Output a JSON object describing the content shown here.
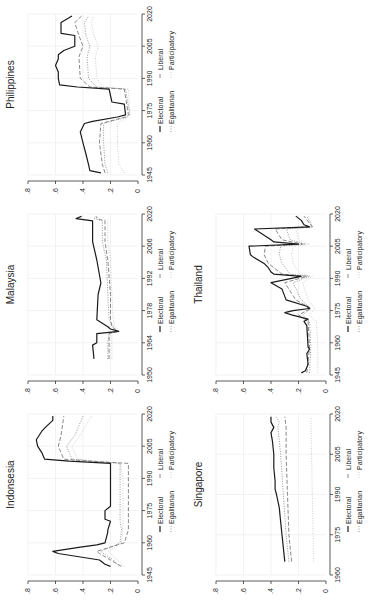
{
  "chart_data": [
    {
      "type": "line",
      "title": "Philippines",
      "xlabel": "",
      "ylabel": "",
      "xticks": [
        1945,
        1960,
        1975,
        1990,
        2005,
        2020
      ],
      "yticks": [
        0,
        0.2,
        0.4,
        0.6,
        0.8
      ],
      "ylim": [
        0,
        0.8
      ],
      "xlim": [
        1945,
        2020
      ],
      "grid": true,
      "legend": [
        "Electoral",
        "Liberal",
        "Egalitarian",
        "Participatory"
      ],
      "series": [
        {
          "name": "Electoral",
          "x": [
            1946,
            1947,
            1950,
            1955,
            1960,
            1965,
            1969,
            1970,
            1972,
            1973,
            1978,
            1979,
            1985,
            1986,
            1987,
            1990,
            1993,
            1996,
            1999,
            2001,
            2003,
            2005,
            2010,
            2011,
            2016,
            2019
          ],
          "values": [
            0.27,
            0.35,
            0.36,
            0.38,
            0.4,
            0.42,
            0.39,
            0.33,
            0.15,
            0.09,
            0.1,
            0.19,
            0.21,
            0.44,
            0.57,
            0.58,
            0.58,
            0.6,
            0.58,
            0.58,
            0.54,
            0.46,
            0.46,
            0.56,
            0.56,
            0.48
          ]
        },
        {
          "name": "Liberal",
          "x": [
            1946,
            1950,
            1960,
            1969,
            1972,
            1973,
            1985,
            1986,
            1990,
            2000,
            2005,
            2010,
            2016,
            2019
          ],
          "values": [
            0.24,
            0.26,
            0.28,
            0.27,
            0.09,
            0.07,
            0.1,
            0.35,
            0.42,
            0.43,
            0.4,
            0.43,
            0.46,
            0.41
          ]
        },
        {
          "name": "Egalitarian",
          "x": [
            1946,
            1950,
            1960,
            1969,
            1972,
            1973,
            1985,
            1986,
            1990,
            2000,
            2005,
            2010,
            2016,
            2019
          ],
          "values": [
            0.22,
            0.24,
            0.25,
            0.25,
            0.08,
            0.06,
            0.09,
            0.3,
            0.36,
            0.37,
            0.35,
            0.38,
            0.39,
            0.36
          ]
        },
        {
          "name": "Participatory",
          "x": [
            1946,
            1950,
            1960,
            1969,
            1972,
            1973,
            1985,
            1986,
            1990,
            2000,
            2005,
            2010,
            2016,
            2019
          ],
          "values": [
            0.1,
            0.14,
            0.15,
            0.15,
            0.07,
            0.06,
            0.07,
            0.25,
            0.3,
            0.31,
            0.29,
            0.32,
            0.34,
            0.32
          ]
        }
      ]
    },
    {
      "type": "line",
      "title": "Malaysia",
      "xticks": [
        1950,
        1964,
        1978,
        1992,
        2006,
        2020
      ],
      "yticks": [
        0,
        0.2,
        0.4,
        0.6,
        0.8
      ],
      "ylim": [
        0,
        0.8
      ],
      "xlim": [
        1950,
        2020
      ],
      "grid": true,
      "legend": [
        "Electoral",
        "Liberal",
        "Egalitarian",
        "Participatory"
      ],
      "series": [
        {
          "name": "Electoral",
          "x": [
            1957,
            1963,
            1964,
            1968,
            1969,
            1970,
            1971,
            1974,
            1985,
            1990,
            2000,
            2008,
            2017,
            2018,
            2019
          ],
          "values": [
            0.32,
            0.33,
            0.3,
            0.3,
            0.14,
            0.2,
            0.22,
            0.3,
            0.29,
            0.27,
            0.3,
            0.33,
            0.33,
            0.45,
            0.41
          ]
        },
        {
          "name": "Liberal",
          "x": [
            1957,
            1964,
            1968,
            1969,
            1971,
            1974,
            1985,
            2000,
            2008,
            2017,
            2018,
            2019
          ],
          "values": [
            0.21,
            0.21,
            0.21,
            0.15,
            0.19,
            0.2,
            0.2,
            0.22,
            0.24,
            0.24,
            0.3,
            0.3
          ]
        },
        {
          "name": "Egalitarian",
          "x": [
            1957,
            1964,
            1968,
            1969,
            1971,
            1974,
            1985,
            2000,
            2008,
            2017,
            2018,
            2019
          ],
          "values": [
            0.22,
            0.22,
            0.21,
            0.15,
            0.18,
            0.21,
            0.22,
            0.23,
            0.26,
            0.26,
            0.32,
            0.31
          ]
        },
        {
          "name": "Participatory",
          "x": [
            1957,
            1964,
            1968,
            1969,
            1971,
            1974,
            1985,
            2000,
            2008,
            2017,
            2018,
            2019
          ],
          "values": [
            0.19,
            0.19,
            0.19,
            0.14,
            0.17,
            0.18,
            0.19,
            0.2,
            0.22,
            0.22,
            0.25,
            0.25
          ]
        }
      ]
    },
    {
      "type": "line",
      "title": "Thailand",
      "xticks": [
        1945,
        1960,
        1975,
        1990,
        2005,
        2020
      ],
      "yticks": [
        0,
        0.2,
        0.4,
        0.6,
        0.8
      ],
      "ylim": [
        0,
        0.8
      ],
      "xlim": [
        1945,
        2020
      ],
      "grid": true,
      "legend": [
        "Electoral",
        "Liberal",
        "Egalitarian",
        "Participatory"
      ],
      "series": [
        {
          "name": "Electoral",
          "x": [
            1946,
            1947,
            1950,
            1955,
            1957,
            1958,
            1968,
            1970,
            1971,
            1973,
            1974,
            1975,
            1976,
            1977,
            1980,
            1985,
            1988,
            1991,
            1992,
            1993,
            1995,
            1997,
            2000,
            2001,
            2005,
            2006,
            2007,
            2008,
            2013,
            2014,
            2015,
            2017,
            2019
          ],
          "values": [
            0.18,
            0.15,
            0.13,
            0.14,
            0.12,
            0.13,
            0.14,
            0.16,
            0.13,
            0.25,
            0.3,
            0.24,
            0.12,
            0.14,
            0.29,
            0.32,
            0.4,
            0.18,
            0.38,
            0.4,
            0.42,
            0.45,
            0.53,
            0.55,
            0.56,
            0.2,
            0.38,
            0.4,
            0.52,
            0.12,
            0.16,
            0.18,
            0.22
          ]
        },
        {
          "name": "Liberal",
          "x": [
            1946,
            1958,
            1970,
            1973,
            1976,
            1980,
            1988,
            1991,
            1992,
            1997,
            2001,
            2005,
            2006,
            2008,
            2013,
            2014,
            2019
          ],
          "values": [
            0.14,
            0.12,
            0.13,
            0.2,
            0.11,
            0.22,
            0.3,
            0.14,
            0.32,
            0.42,
            0.45,
            0.44,
            0.17,
            0.32,
            0.37,
            0.1,
            0.16
          ]
        },
        {
          "name": "Egalitarian",
          "x": [
            1946,
            1958,
            1970,
            1973,
            1976,
            1980,
            1988,
            1991,
            1992,
            1997,
            2001,
            2005,
            2006,
            2008,
            2013,
            2014,
            2019
          ],
          "values": [
            0.12,
            0.11,
            0.12,
            0.17,
            0.11,
            0.18,
            0.24,
            0.12,
            0.26,
            0.32,
            0.34,
            0.33,
            0.15,
            0.26,
            0.29,
            0.1,
            0.14
          ]
        },
        {
          "name": "Participatory",
          "x": [
            1946,
            1958,
            1970,
            1973,
            1976,
            1980,
            1988,
            1991,
            1992,
            1997,
            2001,
            2005,
            2006,
            2008,
            2013,
            2014,
            2019
          ],
          "values": [
            0.06,
            0.06,
            0.07,
            0.12,
            0.08,
            0.13,
            0.17,
            0.1,
            0.19,
            0.24,
            0.25,
            0.24,
            0.12,
            0.2,
            0.22,
            0.1,
            0.13
          ]
        }
      ]
    },
    {
      "type": "line",
      "title": "Indonsesia",
      "xticks": [
        1945,
        1960,
        1975,
        1990,
        2005,
        2020
      ],
      "yticks": [
        0,
        0.2,
        0.4,
        0.6,
        0.8
      ],
      "ylim": [
        0,
        0.8
      ],
      "xlim": [
        1945,
        2020
      ],
      "grid": true,
      "legend": [
        "Electoral",
        "Liberal",
        "Egalitarian",
        "Participatory"
      ],
      "series": [
        {
          "name": "Electoral",
          "x": [
            1949,
            1950,
            1952,
            1955,
            1956,
            1958,
            1959,
            1960,
            1965,
            1966,
            1970,
            1971,
            1975,
            1977,
            1990,
            1997,
            1998,
            1999,
            2002,
            2005,
            2008,
            2012,
            2014,
            2017,
            2019
          ],
          "values": [
            0.2,
            0.24,
            0.28,
            0.58,
            0.62,
            0.42,
            0.3,
            0.24,
            0.22,
            0.22,
            0.2,
            0.24,
            0.24,
            0.2,
            0.2,
            0.2,
            0.5,
            0.68,
            0.7,
            0.73,
            0.74,
            0.7,
            0.67,
            0.62,
            0.62
          ]
        },
        {
          "name": "Liberal",
          "x": [
            1949,
            1952,
            1955,
            1956,
            1959,
            1960,
            1966,
            1970,
            1990,
            1997,
            1998,
            1999,
            2005,
            2010,
            2019
          ],
          "values": [
            0.12,
            0.2,
            0.28,
            0.3,
            0.15,
            0.1,
            0.07,
            0.07,
            0.07,
            0.07,
            0.35,
            0.54,
            0.58,
            0.56,
            0.54
          ]
        },
        {
          "name": "Egalitarian",
          "x": [
            1949,
            1952,
            1955,
            1956,
            1959,
            1960,
            1966,
            1970,
            1990,
            1997,
            1998,
            1999,
            2005,
            2010,
            2019
          ],
          "values": [
            0.14,
            0.18,
            0.25,
            0.27,
            0.16,
            0.13,
            0.12,
            0.13,
            0.13,
            0.13,
            0.32,
            0.48,
            0.52,
            0.46,
            0.4
          ]
        },
        {
          "name": "Participatory",
          "x": [
            1949,
            1952,
            1955,
            1956,
            1959,
            1960,
            1966,
            1970,
            1990,
            1997,
            1998,
            1999,
            2005,
            2010,
            2019
          ],
          "values": [
            0.1,
            0.15,
            0.2,
            0.22,
            0.14,
            0.12,
            0.11,
            0.11,
            0.11,
            0.13,
            0.3,
            0.44,
            0.48,
            0.42,
            0.34
          ]
        }
      ]
    },
    {
      "type": "line",
      "title": "Singapore",
      "xticks": [
        1960,
        1975,
        1990,
        2005,
        2020
      ],
      "yticks": [
        0,
        0.2,
        0.4,
        0.6,
        0.8
      ],
      "ylim": [
        0,
        0.8
      ],
      "xlim": [
        1960,
        2020
      ],
      "grid": true,
      "legend": [
        "Electoral",
        "Liberal",
        "Egalitarian",
        "Participatory"
      ],
      "series": [
        {
          "name": "Electoral",
          "x": [
            1965,
            1970,
            1975,
            1980,
            1985,
            1990,
            1992,
            1995,
            2000,
            2005,
            2010,
            2013,
            2015,
            2017,
            2019
          ],
          "values": [
            0.3,
            0.31,
            0.32,
            0.33,
            0.34,
            0.36,
            0.37,
            0.37,
            0.38,
            0.38,
            0.39,
            0.4,
            0.38,
            0.4,
            0.4
          ]
        },
        {
          "name": "Liberal",
          "x": [
            1965,
            1975,
            1990,
            2005,
            2015,
            2019
          ],
          "values": [
            0.25,
            0.27,
            0.28,
            0.29,
            0.29,
            0.3
          ]
        },
        {
          "name": "Egalitarian",
          "x": [
            1965,
            1975,
            1990,
            2005,
            2015,
            2017,
            2019
          ],
          "values": [
            0.27,
            0.29,
            0.31,
            0.33,
            0.35,
            0.34,
            0.36
          ]
        },
        {
          "name": "Participatory",
          "x": [
            1965,
            1990,
            2019
          ],
          "values": [
            0.09,
            0.1,
            0.11
          ]
        }
      ]
    }
  ],
  "legend": {
    "electoral": "Electoral",
    "liberal": "Liberal",
    "egalitarian": "Egalitarian",
    "participatory": "Participatory"
  },
  "ytick_labels": [
    ".8",
    ".6",
    ".4",
    ".2",
    "0"
  ],
  "colors": {
    "line": "#1a1a1a",
    "dashed": "#7a7a7a",
    "dotted": "#8a8a8a",
    "participatory": "#c8c8c8",
    "grid": "#ececec",
    "axis": "#333333"
  }
}
